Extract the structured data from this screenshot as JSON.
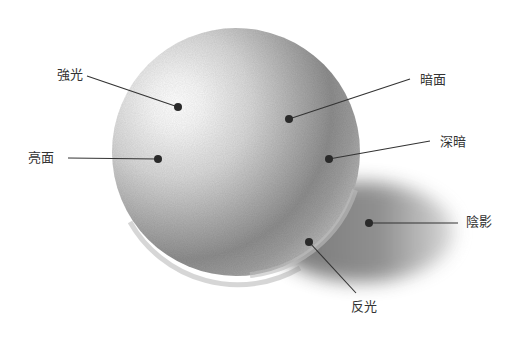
{
  "diagram": {
    "labels": [
      {
        "id": "highlight",
        "text": "強光",
        "x": 57,
        "y": 68,
        "dot": [
          178,
          107
        ],
        "line_from": [
          87,
          76
        ]
      },
      {
        "id": "light-side",
        "text": "亮面",
        "x": 28,
        "y": 151,
        "dot": [
          158,
          159
        ],
        "line_from": [
          68,
          158
        ]
      },
      {
        "id": "dark-side",
        "text": "暗面",
        "x": 420,
        "y": 73,
        "dot": [
          289,
          119
        ],
        "line_from": [
          410,
          79
        ]
      },
      {
        "id": "core-shadow",
        "text": "深暗",
        "x": 440,
        "y": 135,
        "dot": [
          329,
          159
        ],
        "line_from": [
          430,
          141
        ]
      },
      {
        "id": "cast-shadow",
        "text": "陰影",
        "x": 466,
        "y": 215,
        "dot": [
          369,
          223
        ],
        "line_from": [
          458,
          223
        ]
      },
      {
        "id": "reflected-light",
        "text": "反光",
        "x": 351,
        "y": 300,
        "dot": [
          309,
          242
        ],
        "line_from": [
          356,
          293
        ]
      }
    ]
  }
}
